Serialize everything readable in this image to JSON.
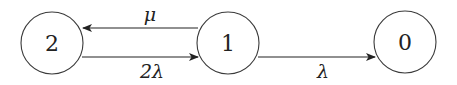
{
  "diagram": {
    "type": "state-transition",
    "nodes": [
      {
        "id": "2",
        "label": "2"
      },
      {
        "id": "1",
        "label": "1"
      },
      {
        "id": "0",
        "label": "0"
      }
    ],
    "edges": [
      {
        "from": "1",
        "to": "2",
        "label": "μ"
      },
      {
        "from": "2",
        "to": "1",
        "label": "2λ"
      },
      {
        "from": "1",
        "to": "0",
        "label": "λ"
      }
    ]
  }
}
